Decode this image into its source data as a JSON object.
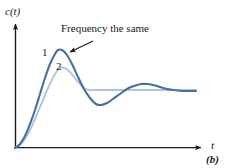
{
  "figure": {
    "caption": "(b)",
    "annotation": "Frequency the same",
    "y_axis_label": "c(t)",
    "x_axis_label": "t",
    "curve_labels": [
      {
        "id": "1",
        "text": "1"
      },
      {
        "id": "2",
        "text": "2"
      }
    ]
  },
  "colors": {
    "curve1": "#4a6f9e",
    "curve2": "#aec4dc",
    "axis": "#1a1a1a",
    "text": "#1a1a1a",
    "background": "#ffffff"
  },
  "chart_data": {
    "type": "line",
    "title": "",
    "subtitle": "",
    "xlabel": "t",
    "ylabel": "c(t)",
    "grid": false,
    "legend": "inline-labels",
    "annotations": [
      {
        "text": "Frequency the same",
        "x_px": 61,
        "y_px": 23,
        "arrow_from_px": [
          93,
          41
        ],
        "arrow_to_px": [
          66,
          54
        ]
      }
    ],
    "axis_pixel_frame": {
      "x_origin_px": 15,
      "y_origin_px": 148,
      "x_arrow_tip_px": 206,
      "y_arrow_tip_px": 20
    },
    "steady_state_y_px": 90,
    "series": [
      {
        "name": "1",
        "label_px": [
          42,
          47
        ],
        "description": "underdamped response, larger overshoot, slower decay",
        "peak_px": [
          58,
          50
        ],
        "trough_px": [
          100,
          105
        ],
        "second_peak_px": [
          146,
          84
        ],
        "points_px": [
          [
            15,
            148
          ],
          [
            20,
            144
          ],
          [
            25,
            136
          ],
          [
            30,
            124
          ],
          [
            35,
            110
          ],
          [
            40,
            94
          ],
          [
            45,
            78
          ],
          [
            50,
            64
          ],
          [
            55,
            54
          ],
          [
            58,
            50
          ],
          [
            62,
            50
          ],
          [
            67,
            55
          ],
          [
            72,
            64
          ],
          [
            78,
            77
          ],
          [
            84,
            89
          ],
          [
            90,
            98
          ],
          [
            96,
            104
          ],
          [
            101,
            105
          ],
          [
            107,
            103
          ],
          [
            113,
            99
          ],
          [
            120,
            94
          ],
          [
            127,
            89
          ],
          [
            134,
            86
          ],
          [
            141,
            84
          ],
          [
            147,
            84
          ],
          [
            153,
            85
          ],
          [
            160,
            87
          ],
          [
            167,
            89
          ],
          [
            174,
            90
          ],
          [
            182,
            91
          ],
          [
            190,
            91
          ],
          [
            196,
            91
          ]
        ]
      },
      {
        "name": "2",
        "label_px": [
          56,
          61
        ],
        "description": "more damped response, smaller overshoot, same oscillation frequency, settles early",
        "peak_px": [
          60,
          68
        ],
        "points_px": [
          [
            15,
            148
          ],
          [
            20,
            145
          ],
          [
            25,
            139
          ],
          [
            30,
            130
          ],
          [
            35,
            119
          ],
          [
            40,
            107
          ],
          [
            45,
            95
          ],
          [
            50,
            84
          ],
          [
            55,
            74
          ],
          [
            60,
            68
          ],
          [
            64,
            68
          ],
          [
            69,
            71
          ],
          [
            74,
            77
          ],
          [
            79,
            83
          ],
          [
            84,
            88
          ],
          [
            89,
            90
          ],
          [
            96,
            90
          ],
          [
            110,
            90
          ],
          [
            130,
            90
          ],
          [
            150,
            90
          ],
          [
            170,
            90
          ],
          [
            185,
            90
          ],
          [
            196,
            90
          ]
        ]
      }
    ]
  }
}
